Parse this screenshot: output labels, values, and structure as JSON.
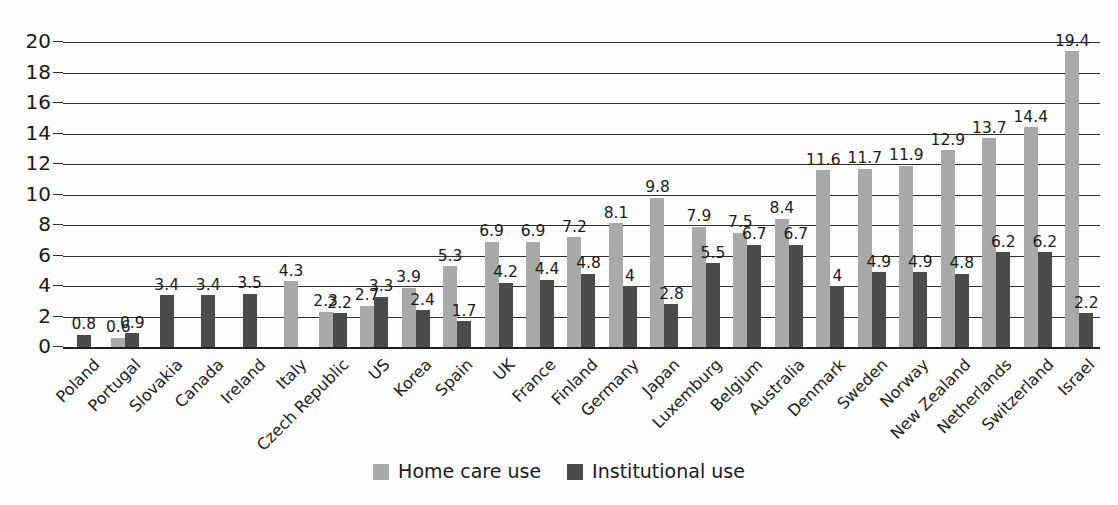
{
  "chart_data": {
    "type": "bar",
    "title": "",
    "xlabel": "",
    "ylabel": "",
    "ylim": [
      0,
      20
    ],
    "ytick_step": 2,
    "yticks": [
      0,
      2,
      4,
      6,
      8,
      10,
      12,
      14,
      16,
      18,
      20
    ],
    "grid": true,
    "legend_position": "bottom-center",
    "categories": [
      "Poland",
      "Portugal",
      "Slovakia",
      "Canada",
      "Ireland",
      "Italy",
      "Czech Republic",
      "US",
      "Korea",
      "Spain",
      "UK",
      "France",
      "Finland",
      "Germany",
      "Japan",
      "Luxemburg",
      "Belgium",
      "Australia",
      "Denmark",
      "Sweden",
      "Norway",
      "New Zealand",
      "Netherlands",
      "Switzerland",
      "Israel"
    ],
    "series": [
      {
        "name": "Home care use",
        "color": "#a9a9a9",
        "values": [
          null,
          0.6,
          null,
          null,
          null,
          4.3,
          2.3,
          2.7,
          3.9,
          5.3,
          6.9,
          6.9,
          7.2,
          8.1,
          9.8,
          7.9,
          7.5,
          8.4,
          11.6,
          11.7,
          11.9,
          12.9,
          13.7,
          14.4,
          19.4
        ],
        "labels": [
          "",
          "0.6",
          "",
          "",
          "",
          "4.3",
          "2.3",
          "2.7",
          "3.9",
          "5.3",
          "6.9",
          "6.9",
          "7.2",
          "8.1",
          "9.8",
          "7.9",
          "7.5",
          "8.4",
          "11.6",
          "11.7",
          "11.9",
          "12.9",
          "13.7",
          "14.4",
          "19.4"
        ]
      },
      {
        "name": "Institutional use",
        "color": "#4b4b4b",
        "values": [
          0.8,
          0.9,
          3.4,
          3.4,
          3.5,
          null,
          2.2,
          3.3,
          2.4,
          1.7,
          4.2,
          4.4,
          4.8,
          4,
          2.8,
          5.5,
          6.7,
          6.7,
          4,
          4.9,
          4.9,
          4.8,
          6.2,
          6.2,
          2.2
        ],
        "labels": [
          "0.8",
          "0.9",
          "3.4",
          "3.4",
          "3.5",
          "",
          "2.2",
          "3.3",
          "2.4",
          "1.7",
          "4.2",
          "4.4",
          "4.8",
          "4",
          "2.8",
          "5.5",
          "6.7",
          "6.7",
          "4",
          "4.9",
          "4.9",
          "4.8",
          "6.2",
          "6.2",
          "2.2"
        ]
      }
    ]
  },
  "legend": {
    "items": [
      {
        "label": "Home care use",
        "swatch": "home"
      },
      {
        "label": "Institutional use",
        "swatch": "inst"
      }
    ]
  },
  "colors": {
    "home_care": "#a9a9a9",
    "institutional": "#4b4b4b",
    "axis": "#2e2e2e",
    "text": "#1a1a1a",
    "background": "#fdfdfd"
  }
}
